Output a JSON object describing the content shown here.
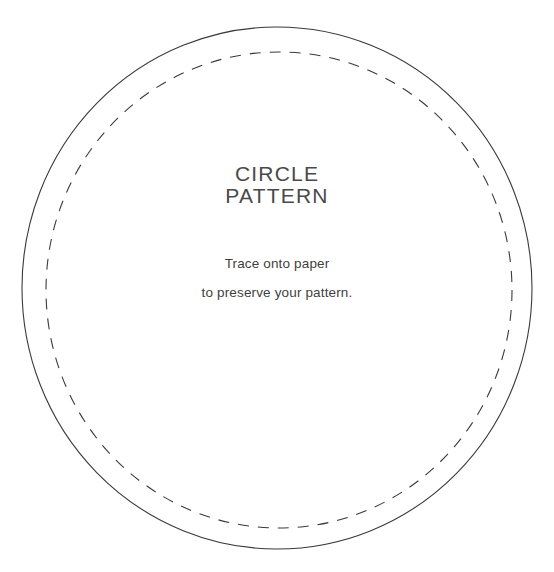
{
  "page": {
    "background_color": "#ffffff",
    "width": 554,
    "height": 572
  },
  "title": {
    "line1": "CIRCLE",
    "line2": "PATTERN",
    "color": "#4a4a4a"
  },
  "instructions": {
    "line1": "Trace onto paper",
    "line2": "to preserve your pattern.",
    "color": "#3f3f3f"
  },
  "shapes": {
    "outer_circle": {
      "name": "cut-line",
      "style": "solid",
      "stroke_color": "#3a3a3a",
      "stroke_width": 1.1,
      "center_x": 277,
      "center_y": 288,
      "radius_x": 255,
      "radius_y": 261,
      "fill": "none"
    },
    "inner_circle": {
      "name": "stitch-line",
      "style": "dashed",
      "stroke_color": "#3a3a3a",
      "stroke_width": 1.1,
      "center_x": 279,
      "center_y": 290,
      "radius_x": 233,
      "radius_y": 238,
      "dash_length": 11,
      "gap_length": 9,
      "fill": "none"
    }
  }
}
